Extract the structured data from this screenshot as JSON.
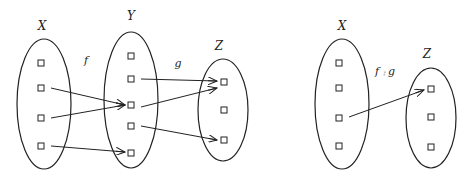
{
  "left_diagram": {
    "sets": [
      {
        "name": "X",
        "label": "X",
        "cx": 44,
        "cy": 104,
        "rx": 27,
        "ry": 65,
        "label_x": 42,
        "label_y": 30,
        "elements_y": [
          63,
          88,
          118,
          146
        ],
        "element_x": 41
      },
      {
        "name": "Y",
        "label": "Y",
        "cx": 131,
        "cy": 100,
        "rx": 27,
        "ry": 68,
        "label_x": 131,
        "label_y": 20,
        "elements_y": [
          56,
          79,
          105,
          126,
          153
        ],
        "element_x": 131
      },
      {
        "name": "Z",
        "label": "Z",
        "cx": 223,
        "cy": 110,
        "rx": 25,
        "ry": 51,
        "label_x": 219,
        "label_y": 50,
        "elements_y": [
          82,
          110,
          140
        ],
        "element_x": 224
      }
    ],
    "functions": [
      {
        "name": "f",
        "label": "f",
        "x": 86,
        "y": 64
      },
      {
        "name": "g",
        "label": "g",
        "x": 178,
        "y": 67
      }
    ],
    "edges": [
      {
        "from": [
          51,
          88
        ],
        "to": [
          125,
          105
        ]
      },
      {
        "from": [
          51,
          118
        ],
        "to": [
          125,
          105
        ]
      },
      {
        "from": [
          51,
          146
        ],
        "to": [
          125,
          152
        ]
      },
      {
        "from": [
          141,
          79
        ],
        "to": [
          217,
          81
        ]
      },
      {
        "from": [
          141,
          107
        ],
        "to": [
          217,
          88
        ]
      },
      {
        "from": [
          141,
          126
        ],
        "to": [
          217,
          140
        ]
      }
    ]
  },
  "right_diagram": {
    "sets": [
      {
        "name": "X",
        "label": "X",
        "cx": 342,
        "cy": 104,
        "rx": 27,
        "ry": 65,
        "label_x": 342,
        "label_y": 30,
        "elements_y": [
          63,
          88,
          118,
          146
        ],
        "element_x": 339
      },
      {
        "name": "Z",
        "label": "Z",
        "cx": 431,
        "cy": 118,
        "rx": 25,
        "ry": 50,
        "label_x": 427,
        "label_y": 58,
        "elements_y": [
          89,
          117,
          147
        ],
        "element_x": 431
      }
    ],
    "functions": [
      {
        "name": "f-compose-g",
        "label": "f ⨾ g",
        "x": 385,
        "y": 75
      }
    ],
    "edges": [
      {
        "from": [
          349,
          117
        ],
        "to": [
          424,
          90
        ]
      }
    ]
  }
}
